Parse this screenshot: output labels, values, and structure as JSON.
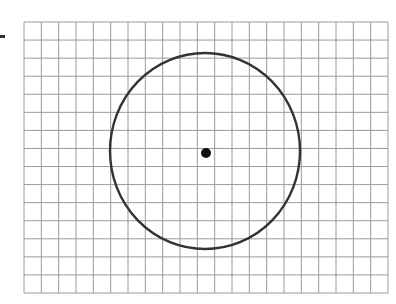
{
  "figure": {
    "grid": {
      "columns": 21,
      "rows": 15,
      "line_color": "#9a9a9a"
    },
    "circle": {
      "stroke_color": "#333333",
      "center_cell": [
        10.5,
        7.2
      ],
      "radius_cells": 5.45
    },
    "center_point": {
      "color": "#111111",
      "label": ""
    },
    "marker_color": "#333333"
  }
}
